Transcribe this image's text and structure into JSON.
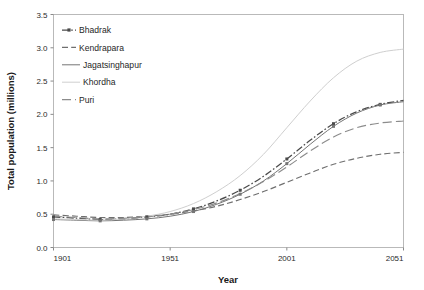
{
  "chart_data": {
    "type": "line",
    "title": "",
    "xlabel": "Year",
    "ylabel": "Total population (millions)",
    "xlim": [
      1901,
      2051
    ],
    "ylim": [
      0.0,
      3.5
    ],
    "grid": false,
    "legend_position": "top-left",
    "x_ticks": [
      "1901",
      "1951",
      "2001",
      "2051"
    ],
    "x_tick_values": [
      1901,
      1951,
      2001,
      2051
    ],
    "y_ticks": [
      "0.0",
      "0.5",
      "1.0",
      "1.5",
      "2.0",
      "2.5",
      "3.0",
      "3.5"
    ],
    "y_tick_values": [
      0.0,
      0.5,
      1.0,
      1.5,
      2.0,
      2.5,
      3.0,
      3.5
    ],
    "x": [
      1901,
      1911,
      1921,
      1931,
      1941,
      1951,
      1961,
      1971,
      1981,
      1991,
      2001,
      2011,
      2021,
      2031,
      2041,
      2051
    ],
    "series": [
      {
        "name": "Bhadrak",
        "style": "dash-dot-marker",
        "color": "#4a4a4a",
        "values": [
          0.46,
          0.44,
          0.42,
          0.43,
          0.46,
          0.5,
          0.58,
          0.7,
          0.86,
          1.07,
          1.33,
          1.61,
          1.86,
          2.04,
          2.15,
          2.21
        ]
      },
      {
        "name": "Kendrapara",
        "style": "dashed",
        "color": "#6f6f6f",
        "values": [
          0.49,
          0.47,
          0.45,
          0.45,
          0.47,
          0.5,
          0.55,
          0.62,
          0.72,
          0.84,
          0.98,
          1.12,
          1.25,
          1.34,
          1.4,
          1.43
        ]
      },
      {
        "name": "Jagatsinghapur",
        "style": "solid-marker",
        "color": "#757575",
        "values": [
          0.42,
          0.41,
          0.4,
          0.41,
          0.43,
          0.47,
          0.54,
          0.65,
          0.8,
          1.0,
          1.26,
          1.55,
          1.82,
          2.02,
          2.14,
          2.19
        ]
      },
      {
        "name": "Khordha",
        "style": "solid-light",
        "color": "#cfcfcf",
        "values": [
          0.43,
          0.42,
          0.41,
          0.43,
          0.47,
          0.54,
          0.66,
          0.84,
          1.08,
          1.4,
          1.8,
          2.2,
          2.55,
          2.8,
          2.93,
          2.98
        ]
      },
      {
        "name": "Puri",
        "style": "dashed-long",
        "color": "#8c8c8c",
        "values": [
          0.47,
          0.45,
          0.43,
          0.44,
          0.46,
          0.5,
          0.57,
          0.67,
          0.81,
          0.99,
          1.21,
          1.45,
          1.66,
          1.8,
          1.87,
          1.9
        ]
      }
    ]
  },
  "legend": {
    "items": [
      {
        "label": "Bhadrak"
      },
      {
        "label": "Kendrapara"
      },
      {
        "label": "Jagatsinghapur"
      },
      {
        "label": "Khordha"
      },
      {
        "label": "Puri"
      }
    ]
  },
  "axes": {
    "x_title": "Year",
    "y_title": "Total population (millions)"
  }
}
